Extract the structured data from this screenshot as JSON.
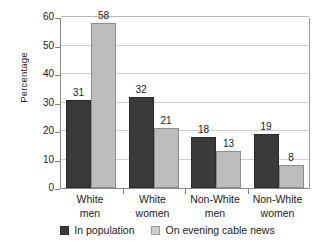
{
  "chart_data": {
    "type": "bar",
    "title": "",
    "xlabel": "",
    "ylabel": "Percentage",
    "ylim": [
      0,
      60
    ],
    "ytick_step": 10,
    "ytick_labels": [
      "0",
      "10",
      "20",
      "30",
      "40",
      "50",
      "60"
    ],
    "grid": "horizontal",
    "legend_position": "bottom",
    "categories": [
      "White men",
      "White women",
      "Non-White men",
      "Non-White women"
    ],
    "category_lines": [
      [
        "White",
        "men"
      ],
      [
        "White",
        "women"
      ],
      [
        "Non-White",
        "men"
      ],
      [
        "Non-White",
        "women"
      ]
    ],
    "series": [
      {
        "name": "In population",
        "color": "#3a3a3a",
        "values": [
          31,
          32,
          18,
          19
        ],
        "labels": [
          "31",
          "32",
          "18",
          "19"
        ]
      },
      {
        "name": "On evening cable news",
        "color": "#bdbdbd",
        "values": [
          58,
          21,
          13,
          8
        ],
        "labels": [
          "58",
          "21",
          "13",
          "8"
        ]
      }
    ]
  },
  "legend": {
    "items": [
      {
        "label": "In population",
        "swatch": "dark-square-icon"
      },
      {
        "label": "On evening cable news",
        "swatch": "light-square-icon"
      }
    ]
  }
}
